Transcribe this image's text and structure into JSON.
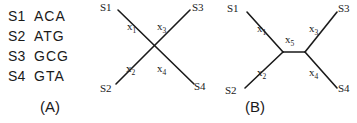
{
  "figure": {
    "panels": [
      {
        "id": "A",
        "caption": "(A)",
        "type": "sequence-list",
        "sequences": [
          {
            "name": "S1",
            "bases": "ACA"
          },
          {
            "name": "S2",
            "bases": "ATG"
          },
          {
            "name": "S3",
            "bases": "GCG"
          },
          {
            "name": "S4",
            "bases": "GTA"
          }
        ]
      },
      {
        "id": "B",
        "caption": "(B)",
        "type": "star-tree",
        "taxa": [
          "S1",
          "S2",
          "S3",
          "S4"
        ],
        "branch_labels": [
          {
            "base": "x",
            "sub": "1"
          },
          {
            "base": "x",
            "sub": "2"
          },
          {
            "base": "x",
            "sub": "3"
          },
          {
            "base": "x",
            "sub": "4"
          }
        ]
      },
      {
        "id": "C",
        "caption": "(C)",
        "type": "unrooted-binary-tree",
        "taxa": [
          "S1",
          "S2",
          "S3",
          "S4"
        ],
        "branch_labels": [
          {
            "base": "x",
            "sub": "1"
          },
          {
            "base": "x",
            "sub": "2"
          },
          {
            "base": "x",
            "sub": "3"
          },
          {
            "base": "x",
            "sub": "4"
          },
          {
            "base": "x",
            "sub": "5"
          }
        ]
      }
    ],
    "colors": {
      "background": "#ffffff",
      "ink": "#1a1a1a"
    }
  }
}
